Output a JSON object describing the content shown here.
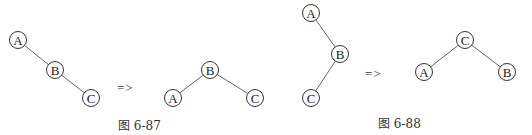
{
  "figures": [
    {
      "caption": "图 6-87",
      "arrow": "=>",
      "before": {
        "nodes": [
          {
            "label": "A",
            "x": 18,
            "y": 40
          },
          {
            "label": "B",
            "x": 55,
            "y": 70
          },
          {
            "label": "C",
            "x": 91,
            "y": 98
          }
        ],
        "edges": [
          [
            "A",
            "B"
          ],
          [
            "B",
            "C"
          ]
        ]
      },
      "after": {
        "nodes": [
          {
            "label": "B",
            "x": 210,
            "y": 70
          },
          {
            "label": "A",
            "x": 173,
            "y": 98
          },
          {
            "label": "C",
            "x": 255,
            "y": 98
          }
        ],
        "edges": [
          [
            "B",
            "A"
          ],
          [
            "B",
            "C"
          ]
        ]
      }
    },
    {
      "caption": "图 6-88",
      "arrow": "=>",
      "before": {
        "nodes": [
          {
            "label": "A",
            "x": 311,
            "y": 13
          },
          {
            "label": "B",
            "x": 340,
            "y": 54
          },
          {
            "label": "C",
            "x": 311,
            "y": 98
          }
        ],
        "edges": [
          [
            "A",
            "B"
          ],
          [
            "B",
            "C"
          ]
        ]
      },
      "after": {
        "nodes": [
          {
            "label": "C",
            "x": 465,
            "y": 40
          },
          {
            "label": "A",
            "x": 424,
            "y": 72
          },
          {
            "label": "B",
            "x": 507,
            "y": 72
          }
        ],
        "edges": [
          [
            "C",
            "A"
          ],
          [
            "C",
            "B"
          ]
        ]
      }
    }
  ]
}
